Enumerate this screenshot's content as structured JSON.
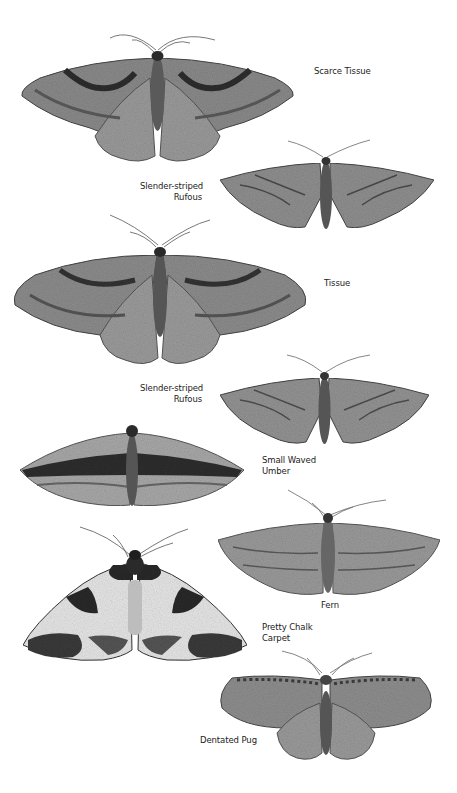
{
  "plate": {
    "background": "#ffffff",
    "specimens": [
      {
        "id": "scarce-tissue",
        "label_lines": [
          "Scarce Tissue"
        ],
        "wing_tone": "#8a8a8a",
        "band_tone": "#3a3a3a"
      },
      {
        "id": "slender-striped-rufous-1",
        "label_lines": [
          "Slender-striped",
          "Rufous"
        ],
        "wing_tone": "#8f8f8f",
        "band_tone": "#4a4a4a"
      },
      {
        "id": "tissue",
        "label_lines": [
          "Tissue"
        ],
        "wing_tone": "#8c8c8c",
        "band_tone": "#3a3a3a"
      },
      {
        "id": "slender-striped-rufous-2",
        "label_lines": [
          "Slender-striped",
          "Rufous"
        ],
        "wing_tone": "#939393",
        "band_tone": "#4e4e4e"
      },
      {
        "id": "small-waved-umber",
        "label_lines": [
          "Small Waved",
          "Umber"
        ],
        "wing_tone": "#a2a2a2",
        "band_tone": "#2e2e2e"
      },
      {
        "id": "fern",
        "label_lines": [
          "Fern"
        ],
        "wing_tone": "#9a9a9a",
        "band_tone": "#5a5a5a"
      },
      {
        "id": "pretty-chalk-carpet",
        "label_lines": [
          "Pretty Chalk",
          "Carpet"
        ],
        "wing_tone": "#e6e6e6",
        "band_tone": "#2a2a2a"
      },
      {
        "id": "dentated-pug",
        "label_lines": [
          "Dentated Pug"
        ],
        "wing_tone": "#8e8e8e",
        "band_tone": "#3c3c3c"
      }
    ]
  }
}
